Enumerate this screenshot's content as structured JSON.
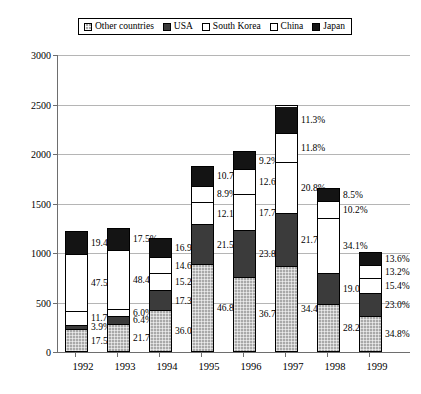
{
  "legend": {
    "entries": [
      {
        "label": "Other countries",
        "swatch": "light-gray-hatched",
        "color": "#a9a9a9"
      },
      {
        "label": "USA",
        "swatch": "dark-gray",
        "color": "#3b3b3b"
      },
      {
        "label": "South Korea",
        "swatch": "white",
        "color": "#ffffff"
      },
      {
        "label": "China",
        "swatch": "white",
        "color": "#ffffff"
      },
      {
        "label": "Japan",
        "swatch": "black",
        "color": "#141414"
      }
    ]
  },
  "axis": {
    "y_ticks": [
      "3000",
      "2500",
      "2000",
      "1500",
      "1000",
      "500",
      "0"
    ],
    "x_ticks": [
      "1992",
      "1993",
      "1994",
      "1995",
      "1996",
      "1997",
      "1998",
      "1999"
    ]
  },
  "chart_data": {
    "type": "bar",
    "title": "",
    "xlabel": "",
    "ylabel": "",
    "ylim": [
      0,
      3000
    ],
    "ytick_step": 500,
    "grid": true,
    "stacked": true,
    "legend_position": "top",
    "categories": [
      "1992",
      "1993",
      "1994",
      "1995",
      "1996",
      "1997",
      "1998",
      "1999"
    ],
    "totals": [
      1200,
      1230,
      1130,
      1860,
      2010,
      2470,
      1640,
      990
    ],
    "series": [
      {
        "name": "Other countries",
        "color": "#a9a9a9",
        "percent_labels": [
          "17.5%",
          "21.7%",
          "36.0%",
          "46.8%",
          "36.7%",
          "34.4%",
          "28.2%",
          "34.8%"
        ],
        "values": [
          17.5,
          21.7,
          36.0,
          46.8,
          36.7,
          34.4,
          28.2,
          34.8
        ]
      },
      {
        "name": "USA",
        "color": "#3b3b3b",
        "percent_labels": [
          "3.9%",
          "6.4%",
          "17.3%",
          "21.5%",
          "23.8%",
          "21.7%",
          "19.0%",
          "23.0%"
        ],
        "values": [
          3.9,
          6.4,
          17.3,
          21.5,
          23.8,
          21.7,
          19.0,
          23.0
        ]
      },
      {
        "name": "South Korea",
        "color": "#ffffff",
        "percent_labels": [
          "11.7%",
          "6.0%",
          "15.2%",
          "12.1%",
          "17.7%",
          "20.8%",
          "34.1%",
          "15.4%"
        ],
        "values": [
          11.7,
          6.0,
          15.2,
          12.1,
          17.7,
          20.8,
          34.1,
          15.4
        ]
      },
      {
        "name": "China",
        "color": "#ffffff",
        "percent_labels": [
          "47.5%",
          "48.4%",
          "14.6%",
          "8.9%",
          "12.6%",
          "11.8%",
          "10.2%",
          "13.2%"
        ],
        "values": [
          47.5,
          48.4,
          14.6,
          8.9,
          12.6,
          11.8,
          10.2,
          13.2
        ]
      },
      {
        "name": "Japan",
        "color": "#141414",
        "percent_labels": [
          "19.4%",
          "17.5%",
          "16.9%",
          "10.7%",
          "9.2%",
          "11.3%",
          "8.5%",
          "13.6%"
        ],
        "values": [
          19.4,
          17.5,
          16.9,
          10.7,
          9.2,
          11.3,
          8.5,
          13.6
        ]
      }
    ]
  }
}
